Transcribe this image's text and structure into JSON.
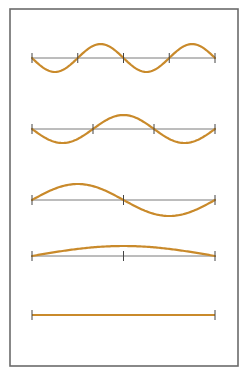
{
  "figure": {
    "frame": {
      "x": 10,
      "y": 9,
      "width": 228,
      "height": 357,
      "stroke": "#6b6b6b"
    },
    "axis_color": "#7a7a7a",
    "tick_color": "#444444",
    "wave_color": "#c98a2b",
    "string_x_start": 32,
    "string_x_end": 215,
    "modes": [
      {
        "name": "mode-4-half-waves",
        "baseline_y": 58,
        "half_waves": 4,
        "amplitude": 14,
        "phase": "down-first",
        "nodes": 5
      },
      {
        "name": "mode-3-half-waves",
        "baseline_y": 129,
        "half_waves": 3,
        "amplitude": 14,
        "phase": "down-first",
        "nodes": 4
      },
      {
        "name": "mode-2-half-waves",
        "baseline_y": 200,
        "half_waves": 2,
        "amplitude": 16,
        "phase": "up-first",
        "nodes": 3
      },
      {
        "name": "mode-1-half-wave",
        "baseline_y": 256,
        "half_waves": 1,
        "amplitude": 10,
        "phase": "up-first",
        "nodes": 3
      },
      {
        "name": "mode-0-flat",
        "baseline_y": 315,
        "half_waves": 0,
        "amplitude": 0,
        "phase": "flat",
        "nodes": 2
      }
    ]
  }
}
